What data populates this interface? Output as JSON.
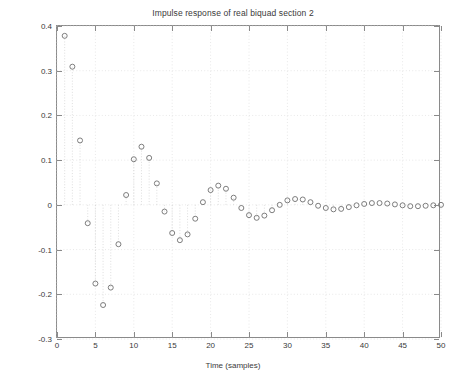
{
  "chart_data": {
    "type": "scatter",
    "title": "Impulse response of real biquad section 2",
    "xlabel": "Time (samples)",
    "ylabel": "Amplitude",
    "xlim": [
      0,
      50
    ],
    "ylim": [
      -0.3,
      0.4
    ],
    "xticks": [
      0,
      5,
      10,
      15,
      20,
      25,
      30,
      35,
      40,
      45,
      50
    ],
    "xtick_labels": [
      "0",
      "5",
      "10",
      "15",
      "20",
      "25",
      "30",
      "35",
      "40",
      "45",
      "50"
    ],
    "yticks": [
      -0.3,
      -0.2,
      -0.1,
      0,
      0.1,
      0.2,
      0.3,
      0.4
    ],
    "ytick_labels": [
      "-0.3",
      "-0.2",
      "-0.1",
      "0",
      "0.1",
      "0.2",
      "0.3",
      "0.4"
    ],
    "grid": true,
    "legend": "none",
    "marker": "circle-open",
    "stems": true,
    "x": [
      1,
      2,
      3,
      4,
      5,
      6,
      7,
      8,
      9,
      10,
      11,
      12,
      13,
      14,
      15,
      16,
      17,
      18,
      19,
      20,
      21,
      22,
      23,
      24,
      25,
      26,
      27,
      28,
      29,
      30,
      31,
      32,
      33,
      34,
      35,
      36,
      37,
      38,
      39,
      40,
      41,
      42,
      43,
      44,
      45,
      46,
      47,
      48,
      49,
      50
    ],
    "y": [
      0.378,
      0.309,
      0.144,
      -0.041,
      -0.176,
      -0.224,
      -0.185,
      -0.088,
      0.022,
      0.102,
      0.13,
      0.105,
      0.048,
      -0.015,
      -0.063,
      -0.079,
      -0.066,
      -0.031,
      0.006,
      0.033,
      0.043,
      0.036,
      0.016,
      -0.007,
      -0.023,
      -0.029,
      -0.024,
      -0.012,
      0.0,
      0.01,
      0.013,
      0.012,
      0.006,
      -0.002,
      -0.007,
      -0.01,
      -0.009,
      -0.005,
      -0.001,
      0.002,
      0.004,
      0.004,
      0.003,
      0.001,
      -0.001,
      -0.003,
      -0.003,
      -0.002,
      -0.001,
      0.0
    ]
  }
}
